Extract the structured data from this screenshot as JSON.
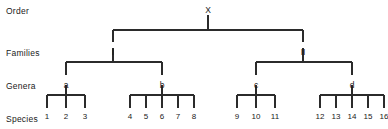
{
  "diagram": {
    "type": "hierarchy-tree",
    "line_color": "#2b2b2b",
    "text_color": "#1a1a1a",
    "background": "#ffffff",
    "ranks": [
      {
        "name": "order",
        "label": "Order",
        "x": 6,
        "y": 6
      },
      {
        "name": "families",
        "label": "Families",
        "x": 6,
        "y": 48
      },
      {
        "name": "genera",
        "label": "Genera",
        "x": 6,
        "y": 81
      },
      {
        "name": "species",
        "label": "Species",
        "x": 6,
        "y": 114
      }
    ],
    "order_node": {
      "label": "X",
      "x": 208,
      "y": 5
    },
    "family_nodes": [
      {
        "label": "I",
        "x": 113,
        "y": 47
      },
      {
        "label": "II",
        "x": 303,
        "y": 47
      }
    ],
    "genus_nodes": [
      {
        "label": "a",
        "x": 66,
        "y": 80
      },
      {
        "label": "b",
        "x": 162,
        "y": 80
      },
      {
        "label": "c",
        "x": 256,
        "y": 80
      },
      {
        "label": "d",
        "x": 352,
        "y": 80
      }
    ],
    "species_groups": [
      {
        "genus": "a",
        "items": [
          {
            "label": "1",
            "x": 47
          },
          {
            "label": "2",
            "x": 66
          },
          {
            "label": "3",
            "x": 85
          }
        ]
      },
      {
        "genus": "b",
        "items": [
          {
            "label": "4",
            "x": 130
          },
          {
            "label": "5",
            "x": 146
          },
          {
            "label": "6",
            "x": 162
          },
          {
            "label": "7",
            "x": 178
          },
          {
            "label": "8",
            "x": 194
          }
        ]
      },
      {
        "genus": "c",
        "items": [
          {
            "label": "9",
            "x": 237
          },
          {
            "label": "10",
            "x": 256
          },
          {
            "label": "11",
            "x": 275
          }
        ]
      },
      {
        "genus": "d",
        "items": [
          {
            "label": "12",
            "x": 320
          },
          {
            "label": "13",
            "x": 336
          },
          {
            "label": "14",
            "x": 352
          },
          {
            "label": "15",
            "x": 368
          },
          {
            "label": "16",
            "x": 384
          }
        ]
      }
    ],
    "geometry": {
      "order_stem_top": 15,
      "order_stem_bottom": 30,
      "family_bar_y": 30,
      "family_drop_bottom": 42,
      "genus_bar_y": 62,
      "genus_stem_top": 55,
      "genus_drop_bottom": 75,
      "species_bar_y": 95,
      "species_stem_top": 88,
      "species_tick_bottom": 108,
      "species_label_y": 112
    }
  }
}
